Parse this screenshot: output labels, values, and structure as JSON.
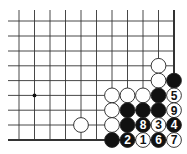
{
  "diagram": {
    "type": "go-board-fragment",
    "columns": 11,
    "rows": 9,
    "grid_x": [
      19,
      34.5,
      50,
      65.5,
      81,
      96.5,
      112,
      127.5,
      143,
      158.5,
      174
    ],
    "grid_y": [
      21,
      36,
      51,
      65.8,
      80.6,
      95.4,
      110.2,
      125,
      140
    ],
    "edges": {
      "right": true,
      "bottom": true
    },
    "line_color": "#333333",
    "star_points": [
      [
        1,
        5
      ]
    ],
    "stone_radius": 7.4,
    "colors": {
      "black": "#111111",
      "white": "#ffffff",
      "outline": "#222222"
    },
    "stones": [
      {
        "col": 9,
        "row": 3,
        "color": "white",
        "label": ""
      },
      {
        "col": 9,
        "row": 4,
        "color": "white",
        "label": ""
      },
      {
        "col": 10,
        "row": 4,
        "color": "black",
        "label": ""
      },
      {
        "col": 6,
        "row": 5,
        "color": "white",
        "label": ""
      },
      {
        "col": 7,
        "row": 5,
        "color": "white",
        "label": ""
      },
      {
        "col": 8,
        "row": 5,
        "color": "white",
        "label": ""
      },
      {
        "col": 9,
        "row": 5,
        "color": "black",
        "label": ""
      },
      {
        "col": 10,
        "row": 5,
        "color": "white",
        "label": "5"
      },
      {
        "col": 6,
        "row": 6,
        "color": "white",
        "label": ""
      },
      {
        "col": 7,
        "row": 6,
        "color": "black",
        "label": ""
      },
      {
        "col": 8,
        "row": 6,
        "color": "black",
        "label": ""
      },
      {
        "col": 9,
        "row": 6,
        "color": "black",
        "label": ""
      },
      {
        "col": 10,
        "row": 6,
        "color": "white",
        "label": "9"
      },
      {
        "col": 4,
        "row": 7,
        "color": "white",
        "label": ""
      },
      {
        "col": 6,
        "row": 7,
        "color": "white",
        "label": ""
      },
      {
        "col": 7,
        "row": 7,
        "color": "black",
        "label": ""
      },
      {
        "col": 8,
        "row": 7,
        "color": "black",
        "label": "8"
      },
      {
        "col": 9,
        "row": 7,
        "color": "white",
        "label": "3"
      },
      {
        "col": 10,
        "row": 7,
        "color": "black",
        "label": "4"
      },
      {
        "col": 6,
        "row": 8,
        "color": "black",
        "label": ""
      },
      {
        "col": 7,
        "row": 8,
        "color": "black",
        "label": "2"
      },
      {
        "col": 8,
        "row": 8,
        "color": "white",
        "label": "1"
      },
      {
        "col": 9,
        "row": 8,
        "color": "black",
        "label": "6"
      },
      {
        "col": 10,
        "row": 8,
        "color": "white",
        "label": "7"
      }
    ]
  }
}
